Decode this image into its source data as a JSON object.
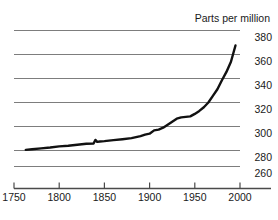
{
  "chart_data": {
    "type": "line",
    "title": "Parts per million",
    "xlabel": "",
    "ylabel": "",
    "xlim": [
      1750,
      2000
    ],
    "ylim": [
      250,
      382
    ],
    "grid": true,
    "legend": false,
    "xticks": [
      1750,
      1800,
      1850,
      1900,
      1950,
      2000
    ],
    "yticks": [
      260,
      280,
      300,
      320,
      340,
      360,
      380
    ],
    "series": [
      {
        "name": "Carbon dioxide concentration",
        "color": "#111111",
        "x": [
          1763,
          1770,
          1780,
          1790,
          1800,
          1810,
          1820,
          1830,
          1838,
          1840,
          1842,
          1845,
          1850,
          1855,
          1860,
          1870,
          1880,
          1890,
          1895,
          1900,
          1905,
          1910,
          1915,
          1920,
          1925,
          1930,
          1935,
          1940,
          1945,
          1950,
          1955,
          1960,
          1965,
          1970,
          1975,
          1980,
          1985,
          1990,
          1995
        ],
        "y": [
          280.5,
          281.0,
          281.8,
          282.5,
          283.4,
          284.0,
          284.8,
          285.6,
          285.8,
          288.8,
          287.2,
          287.5,
          287.8,
          288.2,
          288.6,
          289.4,
          290.3,
          292.0,
          293.2,
          294.0,
          296.8,
          297.4,
          299.0,
          301.5,
          304.0,
          306.5,
          307.6,
          308.0,
          308.4,
          310.5,
          313.0,
          316.0,
          320.0,
          325.5,
          331.0,
          338.5,
          345.5,
          354.0,
          367.5
        ]
      }
    ]
  },
  "axis": {
    "title": "Parts per million",
    "y_tick_labels": [
      "380",
      "360",
      "340",
      "320",
      "300",
      "280",
      "260"
    ],
    "x_tick_labels": [
      "1750",
      "1800",
      "1850",
      "1900",
      "1950",
      "2000"
    ]
  },
  "colors": {
    "line": "#111111",
    "grid": "#7d7d7d",
    "axis": "#4a4a4a",
    "text": "#1a1a1a",
    "background": "#ffffff"
  }
}
